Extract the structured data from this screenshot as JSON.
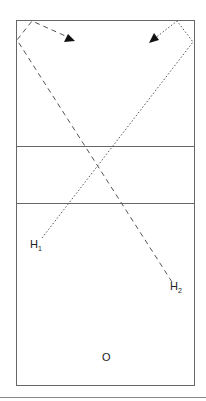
{
  "diagram": {
    "type": "volleyball court play diagram",
    "labels": {
      "h1": "H",
      "h1_sub": "1",
      "h2": "H",
      "h2_sub": "2",
      "origin": "O"
    },
    "paths": [
      {
        "name": "h2-path",
        "style": "dashed",
        "from": "H2",
        "description": "dashed path from H2 to top-left corner then arrow right"
      },
      {
        "name": "h1-path",
        "style": "dotted",
        "from": "H1",
        "description": "dotted path from H1 to top-right corner then arrow left"
      }
    ]
  }
}
